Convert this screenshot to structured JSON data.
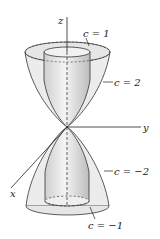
{
  "figure": {
    "axes": {
      "x": "x",
      "y": "y",
      "z": "z"
    },
    "labels": [
      {
        "id": "c1",
        "text": "c = 1"
      },
      {
        "id": "c2",
        "text": "c = 2"
      },
      {
        "id": "cm2",
        "text": "c = −2"
      },
      {
        "id": "cm1",
        "text": "c = −1"
      }
    ],
    "colors": {
      "surface_fill": "#e8e8e8",
      "surface_shade": "#c8c8c8",
      "line": "#222222"
    }
  }
}
